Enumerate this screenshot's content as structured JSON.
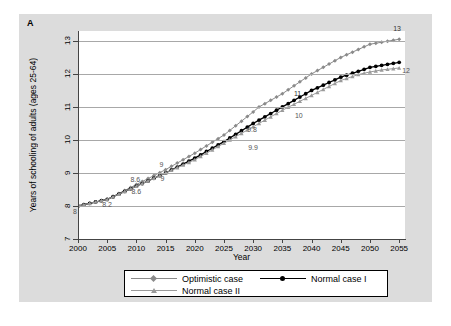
{
  "panel": {
    "label": "A"
  },
  "axes": {
    "ylabel": "Years of schooling of adults (ages 25-64)",
    "xlabel": "Year",
    "yticks": [
      "7",
      "8",
      "9",
      "10",
      "11",
      "12",
      "13"
    ],
    "xticks": [
      "2000",
      "2005",
      "2010",
      "2015",
      "2020",
      "2025",
      "2030",
      "2035",
      "2040",
      "2045",
      "2050",
      "2055"
    ]
  },
  "legend": {
    "items": [
      {
        "label": "Optimistic case",
        "color": "#8a8a8a",
        "marker": "diamond"
      },
      {
        "label": "Normal case I",
        "color": "#000000",
        "marker": "circle"
      },
      {
        "label": "Normal case II",
        "color": "#9a9a9a",
        "marker": "triangle"
      }
    ]
  },
  "annotations": [
    {
      "text": "8",
      "x": 2000,
      "y": 8.0,
      "pos": "below"
    },
    {
      "text": "8.2",
      "x": 2005,
      "y": 8.2,
      "pos": "below"
    },
    {
      "text": "8.6",
      "x": 2010,
      "y": 8.65,
      "pos": "above"
    },
    {
      "text": "8.6",
      "x": 2010,
      "y": 8.6,
      "pos": "below"
    },
    {
      "text": "9",
      "x": 2015,
      "y": 9.1,
      "pos": "above"
    },
    {
      "text": "9",
      "x": 2015,
      "y": 9.0,
      "pos": "below"
    },
    {
      "text": "9.8",
      "x": 2030,
      "y": 10.15,
      "pos": "above"
    },
    {
      "text": "9.9",
      "x": 2030,
      "y": 9.95,
      "pos": "below"
    },
    {
      "text": "11",
      "x": 2038,
      "y": 11.25,
      "pos": "above"
    },
    {
      "text": "10",
      "x": 2038,
      "y": 10.9,
      "pos": "below"
    },
    {
      "text": "13",
      "x": 2055,
      "y": 13.2,
      "pos": "above"
    },
    {
      "text": "12",
      "x": 2055,
      "y": 12.1,
      "pos": "right"
    }
  ],
  "chart_data": {
    "type": "line",
    "title": "",
    "xlabel": "Year",
    "ylabel": "Years of schooling of adults (ages 25-64)",
    "xlim": [
      2000,
      2056
    ],
    "ylim": [
      7,
      13.3
    ],
    "grid": true,
    "legend_position": "bottom",
    "x": [
      2000,
      2001,
      2002,
      2003,
      2004,
      2005,
      2006,
      2007,
      2008,
      2009,
      2010,
      2011,
      2012,
      2013,
      2014,
      2015,
      2016,
      2017,
      2018,
      2019,
      2020,
      2021,
      2022,
      2023,
      2024,
      2025,
      2026,
      2027,
      2028,
      2029,
      2030,
      2031,
      2032,
      2033,
      2034,
      2035,
      2036,
      2037,
      2038,
      2039,
      2040,
      2041,
      2042,
      2043,
      2044,
      2045,
      2046,
      2047,
      2048,
      2049,
      2050,
      2051,
      2052,
      2053,
      2054,
      2055
    ],
    "series": [
      {
        "name": "Optimistic case",
        "color": "#8a8a8a",
        "marker": "diamond",
        "values": [
          8.0,
          8.04,
          8.08,
          8.12,
          8.16,
          8.2,
          8.29,
          8.38,
          8.47,
          8.56,
          8.65,
          8.74,
          8.83,
          8.92,
          9.01,
          9.1,
          9.2,
          9.3,
          9.4,
          9.5,
          9.6,
          9.71,
          9.82,
          9.93,
          10.04,
          10.15,
          10.29,
          10.43,
          10.57,
          10.71,
          10.85,
          11.0,
          11.1,
          11.2,
          11.3,
          11.4,
          11.52,
          11.64,
          11.76,
          11.88,
          12.0,
          12.1,
          12.2,
          12.3,
          12.4,
          12.5,
          12.58,
          12.66,
          12.74,
          12.82,
          12.9,
          12.93,
          12.96,
          12.99,
          13.02,
          13.05
        ]
      },
      {
        "name": "Normal case I",
        "color": "#000000",
        "marker": "circle",
        "values": [
          8.0,
          8.04,
          8.08,
          8.12,
          8.16,
          8.2,
          8.28,
          8.36,
          8.44,
          8.52,
          8.6,
          8.68,
          8.76,
          8.84,
          8.92,
          9.0,
          9.09,
          9.18,
          9.27,
          9.36,
          9.45,
          9.55,
          9.65,
          9.75,
          9.85,
          9.95,
          10.06,
          10.17,
          10.28,
          10.39,
          10.5,
          10.6,
          10.7,
          10.8,
          10.9,
          11.0,
          11.1,
          11.2,
          11.3,
          11.4,
          11.5,
          11.58,
          11.66,
          11.74,
          11.82,
          11.9,
          11.96,
          12.02,
          12.08,
          12.14,
          12.2,
          12.23,
          12.26,
          12.29,
          12.32,
          12.35
        ]
      },
      {
        "name": "Normal case II",
        "color": "#9a9a9a",
        "marker": "triangle",
        "values": [
          8.0,
          8.04,
          8.08,
          8.12,
          8.16,
          8.2,
          8.28,
          8.36,
          8.44,
          8.52,
          8.6,
          8.68,
          8.76,
          8.84,
          8.92,
          9.0,
          9.08,
          9.16,
          9.24,
          9.32,
          9.4,
          9.5,
          9.6,
          9.7,
          9.8,
          9.9,
          10.0,
          10.1,
          10.2,
          10.3,
          10.4,
          10.5,
          10.6,
          10.7,
          10.8,
          10.9,
          10.99,
          11.08,
          11.17,
          11.26,
          11.35,
          11.44,
          11.53,
          11.62,
          11.71,
          11.8,
          11.86,
          11.92,
          11.98,
          12.02,
          12.06,
          12.09,
          12.12,
          12.14,
          12.16,
          12.18
        ]
      }
    ]
  }
}
